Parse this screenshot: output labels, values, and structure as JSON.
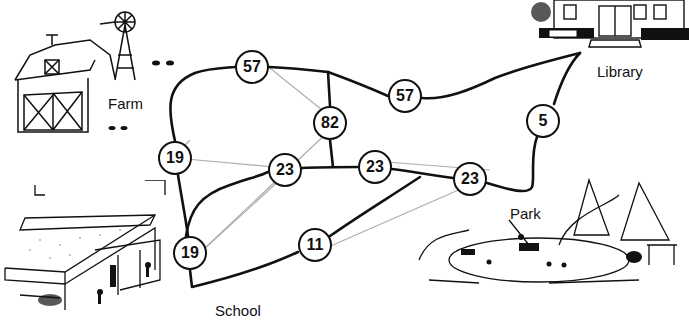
{
  "diagram": {
    "type": "weighted-graph-map",
    "places": [
      {
        "id": "farm",
        "label": "Farm",
        "x": 108,
        "y": 95
      },
      {
        "id": "library",
        "label": "Library",
        "x": 597,
        "y": 63
      },
      {
        "id": "park",
        "label": "Park",
        "x": 510,
        "y": 205
      },
      {
        "id": "school",
        "label": "School",
        "x": 215,
        "y": 302
      }
    ],
    "nodes": [
      {
        "id": "n1",
        "value": "57",
        "x": 252,
        "y": 67
      },
      {
        "id": "n2",
        "value": "57",
        "x": 405,
        "y": 96
      },
      {
        "id": "n3",
        "value": "82",
        "x": 330,
        "y": 123
      },
      {
        "id": "n4",
        "value": "19",
        "x": 175,
        "y": 158
      },
      {
        "id": "n5",
        "value": "23",
        "x": 285,
        "y": 170
      },
      {
        "id": "n6",
        "value": "23",
        "x": 375,
        "y": 167
      },
      {
        "id": "n7",
        "value": "23",
        "x": 470,
        "y": 179
      },
      {
        "id": "n8",
        "value": "5",
        "x": 543,
        "y": 121
      },
      {
        "id": "n9",
        "value": "19",
        "x": 190,
        "y": 253
      },
      {
        "id": "n10",
        "value": "11",
        "x": 315,
        "y": 245
      }
    ],
    "colors": {
      "road": "#111111",
      "pencil": "#9a9a9a",
      "node_fill": "#ffffff"
    }
  }
}
